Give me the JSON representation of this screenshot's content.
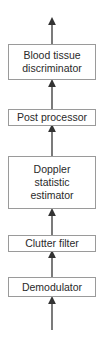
{
  "diagram": {
    "type": "block-flow",
    "direction": "bottom-to-top",
    "blocks": [
      {
        "label": "Blood tissue discriminator",
        "lines": [
          "Blood tissue",
          "discriminator"
        ]
      },
      {
        "label": "Post processor",
        "lines": [
          "Post processor"
        ]
      },
      {
        "label": "Doppler statistic estimator",
        "lines": [
          "Doppler",
          "statistic",
          "estimator"
        ]
      },
      {
        "label": "Clutter filter",
        "lines": [
          "Clutter filter"
        ]
      },
      {
        "label": "Demodulator",
        "lines": [
          "Demodulator"
        ]
      }
    ],
    "edges": [
      {
        "from": "input",
        "to": "Demodulator"
      },
      {
        "from": "Demodulator",
        "to": "Clutter filter"
      },
      {
        "from": "Clutter filter",
        "to": "Doppler statistic estimator"
      },
      {
        "from": "Doppler statistic estimator",
        "to": "Post processor"
      },
      {
        "from": "Post processor",
        "to": "Blood tissue discriminator"
      },
      {
        "from": "Blood tissue discriminator",
        "to": "output"
      }
    ],
    "colors": {
      "line": "#333333",
      "box_border": "#9a9a9a",
      "text": "#2a2a2a"
    }
  }
}
